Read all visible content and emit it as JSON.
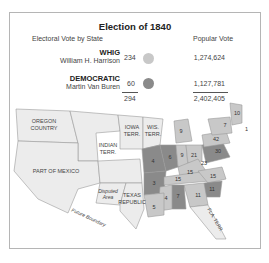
{
  "title": "Election of 1840",
  "legend": {
    "electoral_header": "Electoral Vote by State",
    "popular_header": "Popular Vote",
    "parties": [
      {
        "party": "WHIG",
        "candidate": "William H. Harrison",
        "electoral": "234",
        "popular": "1,274,624",
        "color": "#c8c8c8"
      },
      {
        "party": "DEMOCRATIC",
        "candidate": "Martin Van Buren",
        "electoral": "60",
        "popular": "1,127,781",
        "color": "#8a8a8a"
      }
    ],
    "electoral_total": "294",
    "popular_total": "2,402,405"
  },
  "map": {
    "territory_labels": [
      "OREGON COUNTRY",
      "INDIAN TERR.",
      "IOWA TERR.",
      "WIS. TERR.",
      "PART OF MEXICO",
      "Disputed Area",
      "TEXAS REPUBLIC",
      "FLA. TERR.",
      "Future Boundary"
    ],
    "state_votes": [
      "10",
      "7",
      "14",
      "4",
      "42",
      "8",
      "30",
      "8",
      "3",
      "10",
      "23",
      "21",
      "9",
      "5",
      "4",
      "15",
      "15",
      "15",
      "11",
      "11",
      "7",
      "4",
      "4",
      "5"
    ],
    "colors": {
      "whig": "#c8c8c8",
      "democratic": "#8a8a8a",
      "territory": "#ececec",
      "border": "#9a9a9a"
    }
  }
}
